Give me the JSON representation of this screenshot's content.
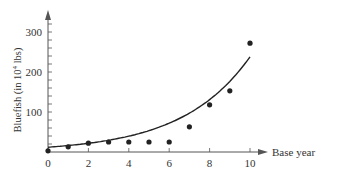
{
  "chart_data": {
    "type": "scatter",
    "title": "",
    "xlabel": "Base year",
    "ylabel": "Bluefish (in 10⁴ lbs)",
    "ylabel_prefix": "Bluefish (in 10",
    "ylabel_sup": "4",
    "ylabel_suffix": " lbs)",
    "xlim": [
      0,
      10
    ],
    "ylim": [
      0,
      350
    ],
    "x_ticks": [
      0,
      2,
      4,
      6,
      8,
      10
    ],
    "x_minor_ticks": [
      1,
      3,
      5,
      7,
      9
    ],
    "y_ticks": [
      100,
      200,
      300
    ],
    "y_minor_step": 20,
    "grid": false,
    "legend": null,
    "series": [
      {
        "name": "observed",
        "kind": "points",
        "x": [
          0,
          1,
          2,
          3,
          4,
          5,
          6,
          7,
          8,
          9,
          10
        ],
        "y": [
          3,
          13,
          22,
          25,
          25,
          25,
          25,
          63,
          118,
          153,
          272
        ]
      },
      {
        "name": "exponential fit",
        "kind": "curve",
        "model": "y = a * b^x",
        "x": [
          0,
          1,
          2,
          3,
          4,
          5,
          6,
          7,
          8,
          9,
          10
        ],
        "y": [
          12,
          16,
          21,
          28,
          38,
          50,
          67,
          90,
          120,
          161,
          238
        ]
      }
    ]
  },
  "colors": {
    "ink": "#222222",
    "axis": "#555555"
  }
}
